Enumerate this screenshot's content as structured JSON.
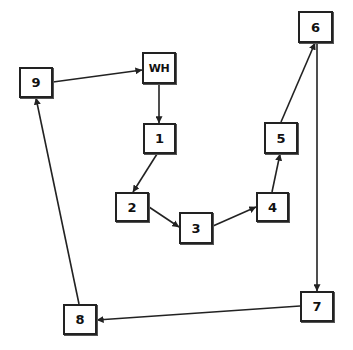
{
  "diagram": {
    "type": "directed-route",
    "colors": {
      "stroke": "#222222",
      "fill": "#ffffff",
      "text": "#111111"
    },
    "nodes": [
      {
        "id": "WH",
        "label": "WH",
        "x": 142,
        "y": 52,
        "w": 34,
        "h": 32
      },
      {
        "id": "1",
        "label": "1",
        "x": 143,
        "y": 123,
        "w": 33,
        "h": 31
      },
      {
        "id": "2",
        "label": "2",
        "x": 115,
        "y": 192,
        "w": 34,
        "h": 30
      },
      {
        "id": "3",
        "label": "3",
        "x": 179,
        "y": 212,
        "w": 34,
        "h": 32
      },
      {
        "id": "4",
        "label": "4",
        "x": 256,
        "y": 192,
        "w": 33,
        "h": 30
      },
      {
        "id": "5",
        "label": "5",
        "x": 264,
        "y": 122,
        "w": 34,
        "h": 32
      },
      {
        "id": "6",
        "label": "6",
        "x": 298,
        "y": 11,
        "w": 35,
        "h": 32
      },
      {
        "id": "7",
        "label": "7",
        "x": 300,
        "y": 291,
        "w": 34,
        "h": 31
      },
      {
        "id": "8",
        "label": "8",
        "x": 63,
        "y": 304,
        "w": 34,
        "h": 31
      },
      {
        "id": "9",
        "label": "9",
        "x": 19,
        "y": 67,
        "w": 34,
        "h": 31
      }
    ],
    "edges": [
      {
        "from": "WH",
        "to": "1",
        "x1": 159,
        "y1": 84,
        "x2": 159,
        "y2": 123
      },
      {
        "from": "1",
        "to": "2",
        "x1": 157,
        "y1": 154,
        "x2": 133,
        "y2": 192
      },
      {
        "from": "2",
        "to": "3",
        "x1": 149,
        "y1": 207,
        "x2": 179,
        "y2": 227
      },
      {
        "from": "3",
        "to": "4",
        "x1": 213,
        "y1": 226,
        "x2": 256,
        "y2": 207
      },
      {
        "from": "4",
        "to": "5",
        "x1": 272,
        "y1": 192,
        "x2": 280,
        "y2": 154
      },
      {
        "from": "5",
        "to": "6",
        "x1": 281,
        "y1": 122,
        "x2": 315,
        "y2": 43
      },
      {
        "from": "6",
        "to": "7",
        "x1": 317,
        "y1": 43,
        "x2": 317,
        "y2": 291
      },
      {
        "from": "7",
        "to": "8",
        "x1": 300,
        "y1": 306,
        "x2": 97,
        "y2": 320
      },
      {
        "from": "8",
        "to": "9",
        "x1": 79,
        "y1": 304,
        "x2": 36,
        "y2": 98
      },
      {
        "from": "9",
        "to": "WH",
        "x1": 53,
        "y1": 82,
        "x2": 142,
        "y2": 70
      }
    ]
  }
}
